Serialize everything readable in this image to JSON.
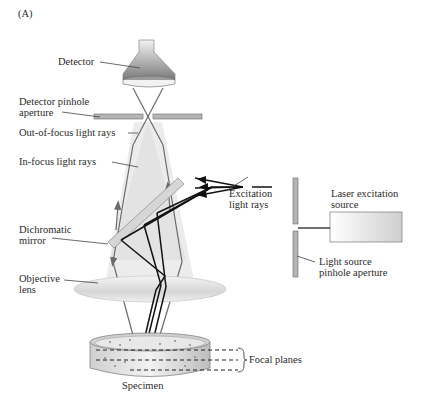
{
  "figure": {
    "panel_label": "(A)"
  },
  "labels": {
    "detector": "Detector",
    "detector_pinhole_line1": "Detector pinhole",
    "detector_pinhole_line2": "aperture",
    "out_of_focus": "Out-of-focus light rays",
    "in_focus": "In-focus light rays",
    "excitation_line1": "Excitation",
    "excitation_line2": "light rays",
    "laser_line1": "Laser excitation",
    "laser_line2": "source",
    "dichromatic_line1": "Dichromatic",
    "dichromatic_line2": "mirror",
    "objective_line1": "Objective",
    "objective_line2": "lens",
    "light_pinhole_line1": "Light source",
    "light_pinhole_line2": "pinhole aperture",
    "focal_planes": "Focal planes",
    "specimen": "Specimen"
  },
  "colors": {
    "detector_fill": "#8a8a8a",
    "aperture_fill": "#b0b0b0",
    "ray_dark": "#111111",
    "ray_gray": "#6a6a6a",
    "cone_fill": "#d8d8d8",
    "lens_fill": "#e4e4e4"
  }
}
